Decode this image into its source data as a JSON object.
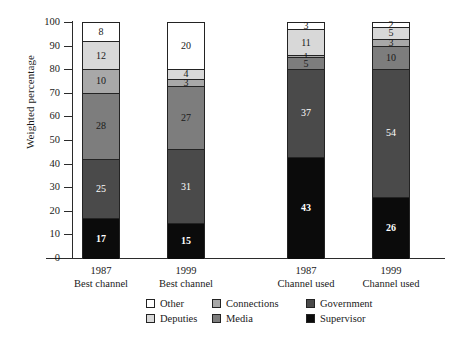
{
  "chart_data": {
    "type": "bar",
    "title": "",
    "subtitle": "",
    "xlabel": "",
    "ylabel": "Weighted percentage",
    "ylim": [
      0,
      100
    ],
    "yticks": [
      0,
      10,
      20,
      30,
      40,
      50,
      60,
      70,
      80,
      90,
      100
    ],
    "grid": false,
    "stacked": true,
    "legend_position": "bottom",
    "categories": [
      "1987 Best channel",
      "1999 Best channel",
      "1987 Channel used",
      "1999 Channel used"
    ],
    "category_lines": [
      {
        "year": "1987",
        "kind": "Best channel"
      },
      {
        "year": "1999",
        "kind": "Best channel"
      },
      {
        "year": "1987",
        "kind": "Channel used"
      },
      {
        "year": "1999",
        "kind": "Channel used"
      }
    ],
    "series": [
      {
        "name": "Supervisor",
        "color": "#0b0b0b",
        "values": [
          17,
          15,
          43,
          26
        ]
      },
      {
        "name": "Government",
        "color": "#4a4a4a",
        "values": [
          25,
          31,
          0,
          0
        ]
      },
      {
        "name": "Media",
        "color": "#7d7d7d",
        "values": [
          28,
          27,
          37,
          54
        ]
      },
      {
        "name": "Connections",
        "color": "#a8a8a8",
        "values": [
          10,
          3,
          5,
          10
        ]
      },
      {
        "name": "Deputies",
        "color": "#d8d8d8",
        "values": [
          12,
          4,
          1,
          3
        ]
      },
      {
        "name": "Other",
        "color": "#ffffff",
        "values": [
          8,
          20,
          3,
          2
        ]
      }
    ],
    "bars": [
      {
        "category": "1987 Best channel",
        "segments": [
          {
            "name": "Other",
            "value": 8,
            "label": "8",
            "color": "#ffffff",
            "label_color": "dark",
            "bold": false
          },
          {
            "name": "Deputies",
            "value": 12,
            "label": "12",
            "color": "#d8d8d8",
            "label_color": "dark",
            "bold": false
          },
          {
            "name": "Connections",
            "value": 10,
            "label": "10",
            "color": "#a8a8a8",
            "label_color": "dark",
            "bold": false
          },
          {
            "name": "Media",
            "value": 28,
            "label": "28",
            "color": "#7d7d7d",
            "label_color": "dark",
            "bold": false
          },
          {
            "name": "Government",
            "value": 25,
            "label": "25",
            "color": "#4a4a4a",
            "label_color": "light",
            "bold": false
          },
          {
            "name": "Supervisor",
            "value": 17,
            "label": "17",
            "color": "#0b0b0b",
            "label_color": "light",
            "bold": true
          }
        ]
      },
      {
        "category": "1999 Best channel",
        "segments": [
          {
            "name": "Other",
            "value": 20,
            "label": "20",
            "color": "#ffffff",
            "label_color": "dark",
            "bold": false
          },
          {
            "name": "Deputies",
            "value": 4,
            "label": "4",
            "color": "#d8d8d8",
            "label_color": "dark",
            "bold": false
          },
          {
            "name": "Connections",
            "value": 3,
            "label": "3",
            "color": "#a8a8a8",
            "label_color": "dark",
            "bold": false
          },
          {
            "name": "Media",
            "value": 27,
            "label": "27",
            "color": "#7d7d7d",
            "label_color": "dark",
            "bold": false
          },
          {
            "name": "Government",
            "value": 31,
            "label": "31",
            "color": "#4a4a4a",
            "label_color": "light",
            "bold": false
          },
          {
            "name": "Supervisor",
            "value": 15,
            "label": "15",
            "color": "#0b0b0b",
            "label_color": "light",
            "bold": true
          }
        ]
      },
      {
        "category": "1987 Channel used",
        "segments": [
          {
            "name": "Other",
            "value": 3,
            "label": "3",
            "color": "#ffffff",
            "label_color": "dark",
            "bold": false
          },
          {
            "name": "Deputies",
            "value": 11,
            "label": "11",
            "color": "#d8d8d8",
            "label_color": "dark",
            "bold": false
          },
          {
            "name": "Connections",
            "value": 1,
            "label": "1",
            "color": "#a8a8a8",
            "label_color": "dark",
            "bold": false
          },
          {
            "name": "Media",
            "value": 5,
            "label": "5",
            "color": "#7d7d7d",
            "label_color": "dark",
            "bold": false
          },
          {
            "name": "Government",
            "value": 37,
            "label": "37",
            "color": "#4a4a4a",
            "label_color": "light",
            "bold": false
          },
          {
            "name": "Supervisor",
            "value": 43,
            "label": "43",
            "color": "#0b0b0b",
            "label_color": "light",
            "bold": true
          }
        ]
      },
      {
        "category": "1999 Channel used",
        "segments": [
          {
            "name": "Other",
            "value": 2,
            "label": "2",
            "color": "#ffffff",
            "label_color": "dark",
            "bold": false
          },
          {
            "name": "Deputies",
            "value": 5,
            "label": "5",
            "color": "#d8d8d8",
            "label_color": "dark",
            "bold": false
          },
          {
            "name": "Connections",
            "value": 3,
            "label": "3",
            "color": "#a8a8a8",
            "label_color": "dark",
            "bold": false
          },
          {
            "name": "Media",
            "value": 10,
            "label": "10",
            "color": "#7d7d7d",
            "label_color": "dark",
            "bold": false
          },
          {
            "name": "Government",
            "value": 54,
            "label": "54",
            "color": "#4a4a4a",
            "label_color": "light",
            "bold": false
          },
          {
            "name": "Supervisor",
            "value": 26,
            "label": "26",
            "color": "#0b0b0b",
            "label_color": "light",
            "bold": true
          }
        ]
      }
    ],
    "legend": [
      {
        "name": "Other",
        "color": "#ffffff"
      },
      {
        "name": "Connections",
        "color": "#a8a8a8"
      },
      {
        "name": "Government",
        "color": "#4a4a4a"
      },
      {
        "name": "Deputies",
        "color": "#d8d8d8"
      },
      {
        "name": "Media",
        "color": "#7d7d7d"
      },
      {
        "name": "Supervisor",
        "color": "#0b0b0b"
      }
    ]
  }
}
